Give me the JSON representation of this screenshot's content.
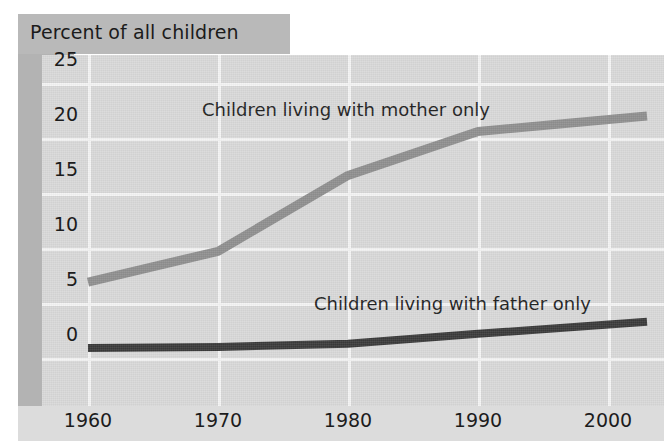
{
  "figure": {
    "title": "Percent of all children",
    "axis_y_title": "Percent of all children"
  },
  "colors": {
    "mother_line": "#8f8f8f",
    "father_line": "#3a3a3a",
    "panel_background": "#d9d9d9",
    "gridline": "#f4f4f4",
    "title_band": "#b9b9b9",
    "side_band": "#b3b3b3",
    "text": "#1c1c1c"
  },
  "labels": {
    "mother": "Children living with mother only",
    "father": "Children living with father only"
  },
  "axes": {
    "y_ticks": [
      "0",
      "5",
      "10",
      "15",
      "20",
      "25"
    ],
    "x_ticks": [
      "1960",
      "1970",
      "1980",
      "1990",
      "2000"
    ]
  },
  "chart_data": {
    "type": "line",
    "title": "Percent of all children",
    "xlabel": "",
    "ylabel": "Percent of all children",
    "xlim": [
      1960,
      2003
    ],
    "ylim": [
      0,
      27.5
    ],
    "yticks": [
      0,
      5,
      10,
      15,
      20,
      25
    ],
    "xticks": [
      1960,
      1970,
      1980,
      1990,
      2000
    ],
    "grid": true,
    "legend": "inline-annotations",
    "x": [
      1960,
      1970,
      1980,
      1990,
      2003
    ],
    "series": [
      {
        "name": "Children living with mother only",
        "color": "#8f8f8f",
        "values": [
          6.9,
          9.7,
          16.6,
          20.6,
          22.0
        ]
      },
      {
        "name": "Children living with father only",
        "color": "#3a3a3a",
        "values": [
          0.9,
          1.0,
          1.3,
          2.2,
          3.3
        ]
      }
    ]
  }
}
